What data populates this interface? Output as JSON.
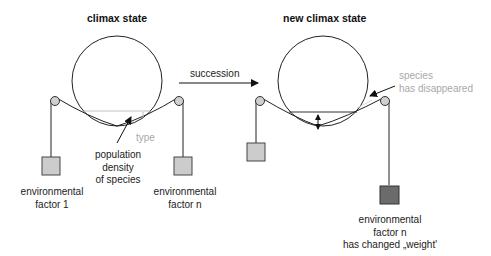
{
  "left_panel": {
    "title": "climax state",
    "labels": {
      "type": "type",
      "population_line1": "population",
      "population_line2": "density",
      "population_line3": "of species",
      "factor1_line1": "environmental",
      "factor1_line2": "factor 1",
      "factorn_line1": "environmental",
      "factorn_line2": "factor n"
    },
    "colors": {
      "weight_fill": "#cccccc",
      "stroke": "#222222",
      "type_line": "#bdbdbd"
    }
  },
  "arrow": {
    "label": "succession"
  },
  "right_panel": {
    "title": "new climax state",
    "labels": {
      "species_line1": "species",
      "species_line2": "has disappeared",
      "factorn_line1": "environmental",
      "factorn_line2": "factor n",
      "factorn_line3": "has changed „weight'"
    },
    "colors": {
      "weight_fill_left": "#cccccc",
      "weight_fill_right": "#6b6b6b",
      "grey_text": "#a8a8a8"
    }
  }
}
